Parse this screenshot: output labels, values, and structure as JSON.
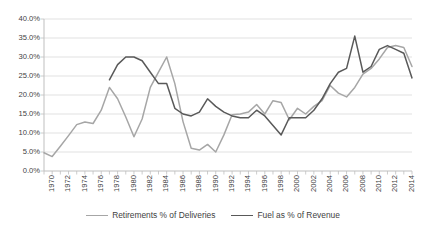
{
  "chart_data": {
    "type": "line",
    "title": "",
    "subtitle": "",
    "xlabel": "",
    "ylabel": "",
    "grid": true,
    "legend_position": "bottom",
    "ylim": [
      0,
      40
    ],
    "ytick_values": [
      0,
      5,
      10,
      15,
      20,
      25,
      30,
      35,
      40
    ],
    "ytick_labels": [
      "0.0%",
      "5.0%",
      "10.0%",
      "15.0%",
      "20.0%",
      "25.0%",
      "30.0%",
      "35.0%",
      "40.0%"
    ],
    "xlim": [
      1970,
      2015
    ],
    "x": [
      1970,
      1971,
      1972,
      1973,
      1974,
      1975,
      1976,
      1977,
      1978,
      1979,
      1980,
      1981,
      1982,
      1983,
      1984,
      1985,
      1986,
      1987,
      1988,
      1989,
      1990,
      1991,
      1992,
      1993,
      1994,
      1995,
      1996,
      1997,
      1998,
      1999,
      2000,
      2001,
      2002,
      2003,
      2004,
      2005,
      2006,
      2007,
      2008,
      2009,
      2010,
      2011,
      2012,
      2013,
      2014,
      2015
    ],
    "xtick_labels": [
      "1970",
      "1972",
      "1974",
      "1976",
      "1978",
      "1980",
      "1982",
      "1984",
      "1986",
      "1988",
      "1990",
      "1992",
      "1994",
      "1996",
      "1998",
      "2000",
      "2002",
      "2004",
      "2006",
      "2008",
      "2010",
      "2012",
      "2014"
    ],
    "xtick_values": [
      1970,
      1972,
      1974,
      1976,
      1978,
      1980,
      1982,
      1984,
      1986,
      1988,
      1990,
      1992,
      1994,
      1996,
      1998,
      2000,
      2002,
      2004,
      2006,
      2008,
      2010,
      2012,
      2014
    ],
    "series": [
      {
        "name": "Retirements % of Deliveries",
        "color": "#a6a6a6",
        "x": [
          1970,
          1971,
          1972,
          1973,
          1974,
          1975,
          1976,
          1977,
          1978,
          1979,
          1980,
          1981,
          1982,
          1983,
          1984,
          1985,
          1986,
          1987,
          1988,
          1989,
          1990,
          1991,
          1992,
          1993,
          1994,
          1995,
          1996,
          1997,
          1998,
          1999,
          2000,
          2001,
          2002,
          2003,
          2004,
          2005,
          2006,
          2007,
          2008,
          2009,
          2010,
          2011,
          2012,
          2013,
          2014,
          2015
        ],
        "values": [
          4.8,
          3.8,
          6.5,
          9.3,
          12.2,
          12.9,
          12.5,
          16.0,
          22.0,
          19.0,
          14.2,
          9.0,
          13.7,
          22.0,
          26.0,
          30.0,
          23.0,
          13.0,
          6.0,
          5.5,
          7.0,
          5.0,
          9.5,
          14.8,
          15.0,
          15.5,
          17.5,
          15.0,
          18.5,
          18.0,
          13.5,
          16.5,
          15.0,
          17.0,
          18.5,
          22.5,
          20.5,
          19.5,
          22.0,
          25.5,
          27.0,
          29.5,
          32.5,
          33.0,
          32.5,
          27.5
        ]
      },
      {
        "name": "Fuel as % of Revenue",
        "color": "#595959",
        "x": [
          1978,
          1979,
          1980,
          1981,
          1982,
          1983,
          1984,
          1985,
          1986,
          1987,
          1988,
          1989,
          1990,
          1991,
          1992,
          1993,
          1994,
          1995,
          1996,
          1997,
          1998,
          1999,
          2000,
          2001,
          2002,
          2003,
          2004,
          2005,
          2006,
          2007,
          2008,
          2009,
          2010,
          2011,
          2012,
          2013,
          2014,
          2015
        ],
        "values": [
          24.0,
          28.0,
          30.0,
          30.0,
          29.0,
          26.0,
          23.0,
          23.0,
          16.5,
          15.0,
          14.5,
          15.5,
          19.0,
          17.0,
          15.5,
          14.5,
          14.0,
          14.0,
          16.0,
          14.5,
          12.0,
          9.5,
          14.0,
          14.0,
          14.0,
          16.0,
          19.0,
          23.0,
          26.0,
          27.0,
          35.5,
          26.0,
          27.5,
          32.0,
          33.0,
          32.0,
          31.0,
          24.5
        ]
      }
    ]
  }
}
